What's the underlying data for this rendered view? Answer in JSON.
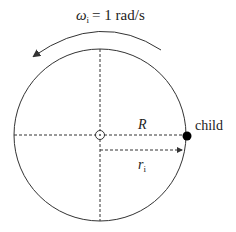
{
  "diagram": {
    "omega_symbol": "ω",
    "omega_subscript": "i",
    "omega_value": "= 1 rad/s",
    "radius_label": "R",
    "r_symbol": "r",
    "r_subscript": "i",
    "child_label": "child",
    "colors": {
      "stroke": "#333333",
      "dot": "#000000"
    }
  }
}
